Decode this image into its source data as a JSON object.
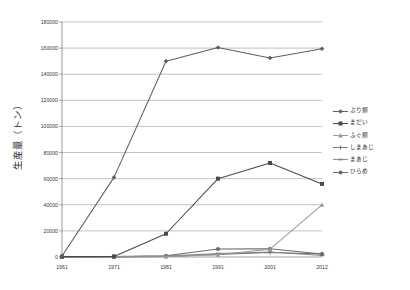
{
  "chart_data": {
    "type": "line",
    "title": "",
    "xlabel": "",
    "ylabel": "生産量（トン）",
    "categories": [
      "1961",
      "1971",
      "1981",
      "1991",
      "2001",
      "2012"
    ],
    "ylim": [
      0,
      180000
    ],
    "ytick_step": 20000,
    "yticks": [
      "0",
      "20000",
      "40000",
      "60000",
      "80000",
      "100000",
      "120000",
      "140000",
      "160000",
      "180000"
    ],
    "grid": true,
    "legend_position": "right",
    "series": [
      {
        "name": "ぶり類",
        "color": "#5f5f5f",
        "marker": "diamond",
        "values": [
          800,
          61000,
          150000,
          160500,
          152500,
          159500
        ]
      },
      {
        "name": "まだい",
        "color": "#4a4a4a",
        "marker": "square",
        "values": [
          300,
          400,
          17800,
          60000,
          72000,
          56000
        ]
      },
      {
        "name": "ふぐ類",
        "color": "#9a9a9a",
        "marker": "triangle",
        "values": [
          0,
          100,
          300,
          1800,
          6000,
          40000
        ]
      },
      {
        "name": "しまあじ",
        "color": "#7a7a7a",
        "marker": "cross",
        "values": [
          0,
          100,
          400,
          2000,
          3500,
          2400
        ]
      },
      {
        "name": "まあじ",
        "color": "#8d8d8d",
        "marker": "dash",
        "values": [
          0,
          200,
          700,
          2600,
          3800,
          1200
        ]
      },
      {
        "name": "ひらめ",
        "color": "#6b6b6b",
        "marker": "circle",
        "values": [
          0,
          300,
          900,
          6200,
          6300,
          2300
        ]
      }
    ]
  },
  "legend": {
    "items": [
      {
        "label": "ぶり類"
      },
      {
        "label": "まだい"
      },
      {
        "label": "ふぐ類"
      },
      {
        "label": "しまあじ"
      },
      {
        "label": "まあじ"
      },
      {
        "label": "ひらめ"
      }
    ]
  }
}
